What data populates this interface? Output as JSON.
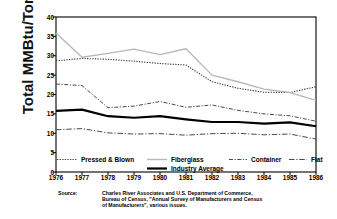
{
  "chart_data": {
    "type": "line",
    "title": "",
    "xlabel": "",
    "ylabel": "Total MMBtu/Ton",
    "ylim": [
      0,
      40
    ],
    "yticks": [
      0,
      5,
      10,
      15,
      20,
      25,
      30,
      35,
      40
    ],
    "grid": false,
    "legend_position": "inside-bottom",
    "categories": [
      1976,
      1977,
      1978,
      1979,
      1980,
      1981,
      1982,
      1983,
      1984,
      1985,
      1986
    ],
    "xticklabels": [
      "1976",
      "1977",
      "1978",
      "1979",
      "1980",
      "1981",
      "1982",
      "1983",
      "1984",
      "1985",
      "1986"
    ],
    "series": [
      {
        "name": "Pressed & Blown",
        "style": "dotted",
        "color": "#3a3a3a",
        "width": 1.1,
        "values": [
          28.7,
          29.3,
          29.1,
          28.6,
          28.0,
          27.6,
          23.3,
          21.6,
          20.6,
          20.5,
          22.0
        ]
      },
      {
        "name": "Fiberglass",
        "style": "solid-light",
        "color": "#b8b8b8",
        "width": 1.4,
        "values": [
          35.9,
          29.6,
          30.6,
          31.7,
          30.3,
          31.8,
          25.0,
          23.3,
          21.4,
          20.5,
          18.5
        ]
      },
      {
        "name": "Container",
        "style": "dash-dot",
        "color": "#4a4a4a",
        "width": 1.0,
        "values": [
          22.7,
          22.3,
          16.6,
          17.0,
          18.2,
          16.7,
          17.3,
          15.9,
          15.0,
          14.5,
          13.1
        ]
      },
      {
        "name": "Flat",
        "style": "dash-dot-long",
        "color": "#4a4a4a",
        "width": 1.0,
        "values": [
          10.9,
          11.2,
          10.1,
          9.8,
          9.9,
          9.5,
          9.9,
          10.0,
          9.6,
          9.8,
          8.5
        ]
      },
      {
        "name": "Industry Average",
        "style": "solid-thick",
        "color": "#000000",
        "width": 2.2,
        "values": [
          15.8,
          16.1,
          14.4,
          14.0,
          14.4,
          13.6,
          12.9,
          12.9,
          12.5,
          12.8,
          11.8
        ]
      }
    ]
  },
  "legend": {
    "items": [
      {
        "label": "Pressed & Blown"
      },
      {
        "label": "Fiberglass"
      },
      {
        "label": "Container"
      },
      {
        "label": "Flat"
      },
      {
        "label": "Industry Average"
      }
    ]
  },
  "source": {
    "label": "Source:",
    "lines": [
      "Charles River Associates and U.S. Department of Commerce,",
      "Bureau of Census, \"Annual Survey of Manufacturers and Census",
      "of Manufacturers\", various issues."
    ]
  }
}
